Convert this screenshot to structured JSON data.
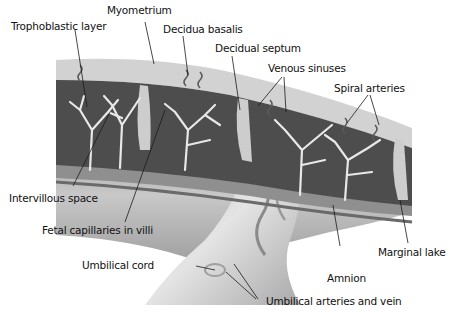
{
  "diagram": {
    "colors": {
      "background": "#ffffff",
      "label_text": "#111111",
      "leader_line": "#1a1a1a",
      "decidua": "#cfcfcf",
      "intervillous_space": "#4a4a4a",
      "villi": "#e6e6e6",
      "chorionic_plate": "#8c8c8c",
      "amnion": "#bdbdbd",
      "umbilical_cord": "#d8d8d8"
    },
    "labels": {
      "myometrium": "Myometrium",
      "trophoblastic_layer": "Trophoblastic layer",
      "decidua_basalis": "Decidua basalis",
      "decidual_septum": "Decidual septum",
      "venous_sinuses": "Venous sinuses",
      "spiral_arteries": "Spiral arteries",
      "intervillous_space": "Intervillous space",
      "fetal_capillaries": "Fetal capillaries in villi",
      "umbilical_cord": "Umbilical cord",
      "marginal_lake": "Marginal lake",
      "amnion": "Amnion",
      "umbilical_vessels": "Umbilical arteries and vein"
    }
  }
}
